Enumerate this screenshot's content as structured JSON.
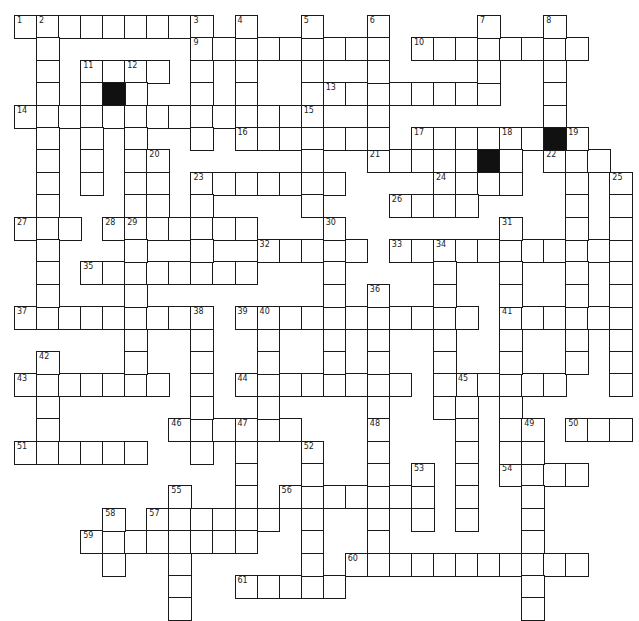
{
  "puzzle": {
    "type": "crossword",
    "colors": {
      "line": "#1a1a1a",
      "block": "#111111",
      "background": "#ffffff"
    },
    "grid_origin": {
      "x": 14,
      "y": 15
    },
    "cell_size": {
      "w": 22.05,
      "h": 22.4
    },
    "clue_numbers": [
      "1",
      "2",
      "3",
      "4",
      "5",
      "6",
      "7",
      "8",
      "9",
      "10",
      "11",
      "12",
      "13",
      "14",
      "15",
      "16",
      "17",
      "18",
      "19",
      "20",
      "21",
      "22",
      "23",
      "24",
      "25",
      "26",
      "27",
      "28",
      "29",
      "30",
      "31",
      "32",
      "33",
      "34",
      "35",
      "36",
      "37",
      "38",
      "39",
      "40",
      "41",
      "42",
      "43",
      "44",
      "45",
      "46",
      "47",
      "48",
      "49",
      "50",
      "51",
      "52",
      "53",
      "54",
      "55",
      "56",
      "57",
      "58",
      "59",
      "60",
      "61"
    ],
    "across_entries": [
      {
        "num": "1",
        "row": 0,
        "col": 0,
        "len": 9
      },
      {
        "num": "9",
        "row": 1,
        "col": 8,
        "len": 8
      },
      {
        "num": "10",
        "row": 1,
        "col": 18,
        "len": 8
      },
      {
        "num": "11",
        "row": 2,
        "col": 3,
        "len": 4
      },
      {
        "num": "13",
        "row": 3,
        "col": 14,
        "len": 8
      },
      {
        "num": "14",
        "row": 4,
        "col": 0,
        "len": 14
      },
      {
        "num": "16",
        "row": 5,
        "col": 10,
        "len": 6
      },
      {
        "num": "17",
        "row": 5,
        "col": 18,
        "len": 6
      },
      {
        "num": "21",
        "row": 6,
        "col": 16,
        "len": 7
      },
      {
        "num": "22",
        "row": 6,
        "col": 24,
        "len": 3
      },
      {
        "num": "23",
        "row": 7,
        "col": 8,
        "len": 7
      },
      {
        "num": "24",
        "row": 7,
        "col": 19,
        "len": 3
      },
      {
        "num": "26",
        "row": 8,
        "col": 17,
        "len": 4
      },
      {
        "num": "27",
        "row": 9,
        "col": 0,
        "len": 3
      },
      {
        "num": "28",
        "row": 9,
        "col": 4,
        "len": 7
      },
      {
        "num": "32",
        "row": 10,
        "col": 11,
        "len": 5
      },
      {
        "num": "33",
        "row": 10,
        "col": 17,
        "len": 11
      },
      {
        "num": "35",
        "row": 11,
        "col": 3,
        "len": 8
      },
      {
        "num": "37",
        "row": 13,
        "col": 0,
        "len": 9
      },
      {
        "num": "39",
        "row": 13,
        "col": 10,
        "len": 11
      },
      {
        "num": "41",
        "row": 13,
        "col": 22,
        "len": 6
      },
      {
        "num": "43",
        "row": 16,
        "col": 0,
        "len": 7
      },
      {
        "num": "44",
        "row": 16,
        "col": 10,
        "len": 8
      },
      {
        "num": "45",
        "row": 16,
        "col": 20,
        "len": 5
      },
      {
        "num": "46",
        "row": 18,
        "col": 7,
        "len": 6
      },
      {
        "num": "50",
        "row": 18,
        "col": 25,
        "len": 3
      },
      {
        "num": "51",
        "row": 19,
        "col": 0,
        "len": 6
      },
      {
        "num": "54",
        "row": 20,
        "col": 22,
        "len": 4
      },
      {
        "num": "56",
        "row": 21,
        "col": 12,
        "len": 7
      },
      {
        "num": "57",
        "row": 22,
        "col": 6,
        "len": 6
      },
      {
        "num": "59",
        "row": 23,
        "col": 3,
        "len": 7
      },
      {
        "num": "60",
        "row": 24,
        "col": 15,
        "len": 11
      },
      {
        "num": "61",
        "row": 25,
        "col": 10,
        "len": 5
      }
    ],
    "down_entries": [
      {
        "num": "2",
        "row": 0,
        "col": 1,
        "len": 13
      },
      {
        "num": "3",
        "row": 0,
        "col": 8,
        "len": 6
      },
      {
        "num": "4",
        "row": 0,
        "col": 10,
        "len": 4
      },
      {
        "num": "5",
        "row": 0,
        "col": 13,
        "len": 9
      },
      {
        "num": "6",
        "row": 0,
        "col": 16,
        "len": 6
      },
      {
        "num": "7",
        "row": 0,
        "col": 21,
        "len": 4
      },
      {
        "num": "8",
        "row": 0,
        "col": 24,
        "len": 5
      },
      {
        "num": "11",
        "row": 2,
        "col": 3,
        "len": 6
      },
      {
        "num": "12",
        "row": 2,
        "col": 5,
        "len": 10
      },
      {
        "num": "15",
        "row": 4,
        "col": 13,
        "len": 5
      },
      {
        "num": "18",
        "row": 5,
        "col": 22,
        "len": 3
      },
      {
        "num": "19",
        "row": 5,
        "col": 25,
        "len": 11
      },
      {
        "num": "20",
        "row": 6,
        "col": 6,
        "len": 4
      },
      {
        "num": "23",
        "row": 7,
        "col": 8,
        "len": 5
      },
      {
        "num": "25",
        "row": 7,
        "col": 27,
        "len": 10
      },
      {
        "num": "29",
        "row": 9,
        "col": 5,
        "len": 8
      },
      {
        "num": "30",
        "row": 9,
        "col": 14,
        "len": 7
      },
      {
        "num": "31",
        "row": 9,
        "col": 22,
        "len": 11
      },
      {
        "num": "34",
        "row": 10,
        "col": 19,
        "len": 8
      },
      {
        "num": "36",
        "row": 12,
        "col": 16,
        "len": 6
      },
      {
        "num": "38",
        "row": 13,
        "col": 8,
        "len": 7
      },
      {
        "num": "40",
        "row": 13,
        "col": 11,
        "len": 6
      },
      {
        "num": "42",
        "row": 15,
        "col": 1,
        "len": 5
      },
      {
        "num": "45",
        "row": 16,
        "col": 20,
        "len": 7
      },
      {
        "num": "47",
        "row": 18,
        "col": 10,
        "len": 6
      },
      {
        "num": "48",
        "row": 18,
        "col": 16,
        "len": 7
      },
      {
        "num": "49",
        "row": 18,
        "col": 23,
        "len": 9
      },
      {
        "num": "52",
        "row": 19,
        "col": 13,
        "len": 7
      },
      {
        "num": "53",
        "row": 20,
        "col": 18,
        "len": 3
      },
      {
        "num": "55",
        "row": 21,
        "col": 7,
        "len": 6
      },
      {
        "num": "58",
        "row": 22,
        "col": 4,
        "len": 3
      }
    ],
    "black_squares": [
      {
        "row": 3,
        "col": 4
      },
      {
        "row": 5,
        "col": 24
      },
      {
        "row": 6,
        "col": 21
      }
    ]
  }
}
